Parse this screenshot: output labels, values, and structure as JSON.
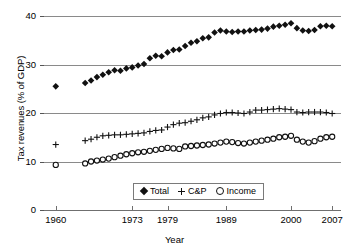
{
  "chart_data": {
    "type": "scatter",
    "title": "",
    "xlabel": "Year",
    "ylabel": "Tax revenues (% of GDP)",
    "xlim": [
      1958,
      2008.5
    ],
    "ylim": [
      0,
      41
    ],
    "grid": true,
    "legend_position": "bottom-center",
    "y_ticks": [
      0,
      10,
      20,
      30,
      40
    ],
    "y_tick_labels": [
      "0",
      "10",
      "20",
      "30",
      "40"
    ],
    "x_ticks": [
      1960,
      1973,
      1979,
      1989,
      2000,
      2007
    ],
    "x_tick_labels": [
      "1960",
      "1973",
      "1979",
      "1989",
      "2000",
      "2007"
    ],
    "note": "Series have a data gap between 1960 and 1965",
    "series": [
      {
        "name": "Total",
        "marker": "filled-diamond",
        "color": "#111111",
        "points": [
          [
            1960,
            25.5
          ],
          [
            1965,
            26.2
          ],
          [
            1966,
            26.7
          ],
          [
            1967,
            27.4
          ],
          [
            1968,
            27.9
          ],
          [
            1969,
            28.4
          ],
          [
            1970,
            28.8
          ],
          [
            1971,
            28.7
          ],
          [
            1972,
            29.2
          ],
          [
            1973,
            29.4
          ],
          [
            1974,
            29.8
          ],
          [
            1975,
            30.1
          ],
          [
            1976,
            31.3
          ],
          [
            1977,
            31.8
          ],
          [
            1978,
            31.7
          ],
          [
            1979,
            32.5
          ],
          [
            1980,
            33.0
          ],
          [
            1981,
            33.1
          ],
          [
            1982,
            33.8
          ],
          [
            1983,
            34.5
          ],
          [
            1984,
            34.8
          ],
          [
            1985,
            35.4
          ],
          [
            1986,
            35.6
          ],
          [
            1987,
            36.6
          ],
          [
            1988,
            37.0
          ],
          [
            1989,
            36.8
          ],
          [
            1990,
            36.7
          ],
          [
            1991,
            36.8
          ],
          [
            1992,
            36.8
          ],
          [
            1993,
            37.0
          ],
          [
            1994,
            37.1
          ],
          [
            1995,
            37.2
          ],
          [
            1996,
            37.4
          ],
          [
            1997,
            37.8
          ],
          [
            1998,
            38.0
          ],
          [
            1999,
            38.2
          ],
          [
            2000,
            38.5
          ],
          [
            2001,
            37.5
          ],
          [
            2002,
            37.0
          ],
          [
            2003,
            36.9
          ],
          [
            2004,
            37.1
          ],
          [
            2005,
            37.9
          ],
          [
            2006,
            38.0
          ],
          [
            2007,
            37.9
          ]
        ]
      },
      {
        "name": "C&P",
        "marker": "plus",
        "color": "#111111",
        "points": [
          [
            1960,
            13.5
          ],
          [
            1965,
            14.3
          ],
          [
            1966,
            14.6
          ],
          [
            1967,
            15.0
          ],
          [
            1968,
            15.3
          ],
          [
            1969,
            15.4
          ],
          [
            1970,
            15.5
          ],
          [
            1971,
            15.5
          ],
          [
            1972,
            15.6
          ],
          [
            1973,
            15.7
          ],
          [
            1974,
            15.8
          ],
          [
            1975,
            15.9
          ],
          [
            1976,
            16.2
          ],
          [
            1977,
            16.4
          ],
          [
            1978,
            16.5
          ],
          [
            1979,
            17.1
          ],
          [
            1980,
            17.6
          ],
          [
            1981,
            17.9
          ],
          [
            1982,
            18.0
          ],
          [
            1983,
            18.3
          ],
          [
            1984,
            18.6
          ],
          [
            1985,
            19.0
          ],
          [
            1986,
            19.2
          ],
          [
            1987,
            19.6
          ],
          [
            1988,
            19.9
          ],
          [
            1989,
            20.1
          ],
          [
            1990,
            20.1
          ],
          [
            1991,
            20.0
          ],
          [
            1992,
            19.9
          ],
          [
            1993,
            20.2
          ],
          [
            1994,
            20.6
          ],
          [
            1995,
            20.6
          ],
          [
            1996,
            20.7
          ],
          [
            1997,
            20.8
          ],
          [
            1998,
            20.9
          ],
          [
            1999,
            20.8
          ],
          [
            2000,
            20.7
          ],
          [
            2001,
            20.2
          ],
          [
            2002,
            20.1
          ],
          [
            2003,
            20.2
          ],
          [
            2004,
            20.2
          ],
          [
            2005,
            20.2
          ],
          [
            2006,
            20.1
          ],
          [
            2007,
            19.9
          ]
        ]
      },
      {
        "name": "Income",
        "marker": "open-circle",
        "color": "#111111",
        "points": [
          [
            1960,
            9.3
          ],
          [
            1965,
            9.6
          ],
          [
            1966,
            10.0
          ],
          [
            1967,
            10.2
          ],
          [
            1968,
            10.4
          ],
          [
            1969,
            10.6
          ],
          [
            1970,
            10.9
          ],
          [
            1971,
            11.2
          ],
          [
            1972,
            11.5
          ],
          [
            1973,
            11.7
          ],
          [
            1974,
            11.9
          ],
          [
            1975,
            12.0
          ],
          [
            1976,
            12.2
          ],
          [
            1977,
            12.4
          ],
          [
            1978,
            12.6
          ],
          [
            1979,
            12.8
          ],
          [
            1980,
            12.7
          ],
          [
            1981,
            12.6
          ],
          [
            1982,
            13.1
          ],
          [
            1983,
            13.2
          ],
          [
            1984,
            13.3
          ],
          [
            1985,
            13.4
          ],
          [
            1986,
            13.5
          ],
          [
            1987,
            13.7
          ],
          [
            1988,
            13.9
          ],
          [
            1989,
            14.1
          ],
          [
            1990,
            14.0
          ],
          [
            1991,
            13.8
          ],
          [
            1992,
            13.7
          ],
          [
            1993,
            13.9
          ],
          [
            1994,
            14.1
          ],
          [
            1995,
            14.3
          ],
          [
            1996,
            14.5
          ],
          [
            1997,
            14.7
          ],
          [
            1998,
            15.0
          ],
          [
            1999,
            15.1
          ],
          [
            2000,
            15.3
          ],
          [
            2001,
            14.5
          ],
          [
            2002,
            14.1
          ],
          [
            2003,
            13.9
          ],
          [
            2004,
            14.2
          ],
          [
            2005,
            14.7
          ],
          [
            2006,
            15.0
          ],
          [
            2007,
            15.1
          ]
        ]
      }
    ]
  },
  "legend": {
    "items": [
      {
        "label": "Total",
        "marker": "filled-diamond"
      },
      {
        "label": "C&P",
        "marker": "plus"
      },
      {
        "label": "Income",
        "marker": "open-circle"
      }
    ]
  }
}
